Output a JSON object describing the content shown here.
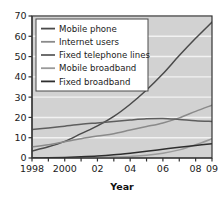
{
  "chart_data": {
    "type": "line",
    "title": "",
    "xlabel": "Year",
    "ylabel": "",
    "xlim": [
      1998,
      2009
    ],
    "ylim": [
      0,
      70
    ],
    "grid": true,
    "grid_axis": "y",
    "legend_position": "top-left",
    "plot_background": "#d2d2d2",
    "grid_color": "#f2f2f2",
    "axis_color": "#333333",
    "x": [
      1998,
      1999,
      2000,
      2001,
      2002,
      2003,
      2004,
      2005,
      2006,
      2007,
      2008,
      2009
    ],
    "xtick_values": [
      1998,
      1999,
      2000,
      2001,
      2002,
      2003,
      2004,
      2005,
      2006,
      2007,
      2008,
      2009
    ],
    "xtick_labels": [
      "1998",
      "",
      "2000",
      "",
      "02",
      "",
      "04",
      "",
      "06",
      "",
      "08",
      "09"
    ],
    "ytick_values": [
      0,
      10,
      20,
      30,
      40,
      50,
      60,
      70
    ],
    "ytick_labels": [
      "0",
      "10",
      "20",
      "30",
      "40",
      "50",
      "60",
      "70"
    ],
    "series": [
      {
        "name": "Mobile phone",
        "color": "#4a4a4a",
        "values": [
          3.5,
          5.5,
          8.2,
          12.0,
          15.8,
          20.5,
          26.5,
          33.5,
          41.5,
          50.5,
          59.0,
          67.0
        ]
      },
      {
        "name": "Internet users",
        "color": "#8a8a8a",
        "values": [
          5.5,
          6.5,
          8.0,
          9.5,
          10.8,
          12.0,
          13.8,
          15.5,
          17.3,
          19.8,
          23.0,
          26.0
        ]
      },
      {
        "name": "Fixed telephone lines",
        "color": "#5e5e5e",
        "values": [
          14.0,
          14.8,
          15.7,
          16.6,
          17.3,
          18.0,
          18.7,
          19.3,
          19.5,
          19.0,
          18.4,
          18.0
        ]
      },
      {
        "name": "Mobile broadband",
        "color": "#9a9a9a",
        "values": [
          0.0,
          0.0,
          0.1,
          0.2,
          0.3,
          0.5,
          0.8,
          1.3,
          2.3,
          4.0,
          6.5,
          9.5
        ]
      },
      {
        "name": "Fixed broadband",
        "color": "#2e2e2e",
        "values": [
          0.0,
          0.1,
          0.3,
          0.6,
          1.0,
          1.6,
          2.4,
          3.3,
          4.3,
          5.3,
          6.2,
          7.0
        ]
      }
    ]
  }
}
